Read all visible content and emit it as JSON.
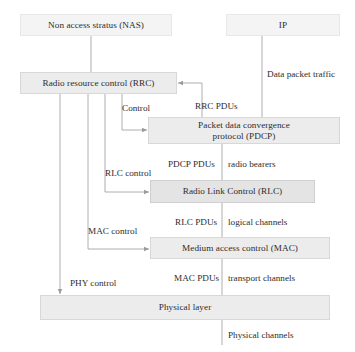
{
  "diagram": {
    "colors": {
      "node_fill": "#ececec",
      "node_fill_faint": "#f4f4f4",
      "node_fill_strong": "#e4e4e4",
      "node_border": "#d8d8d8",
      "line": "#9a9a9a",
      "text": "#2d2d2d"
    },
    "nodes": [
      {
        "id": "nas",
        "label": "Non access stratus (NAS)",
        "x": 20,
        "y": 14,
        "w": 152,
        "h": 22,
        "style": "faint"
      },
      {
        "id": "ip",
        "label": "IP",
        "x": 226,
        "y": 14,
        "w": 114,
        "h": 22,
        "style": "faint"
      },
      {
        "id": "rrc",
        "label": "Radio resource control (RRC)",
        "x": 20,
        "y": 72,
        "w": 157,
        "h": 22,
        "style": "node"
      },
      {
        "id": "pdcp",
        "label": "Packet data convergence\nprotocol (PDCP)",
        "x": 148,
        "y": 117,
        "w": 192,
        "h": 27,
        "style": "node"
      },
      {
        "id": "rlc",
        "label": "Radio Link Control (RLC)",
        "x": 150,
        "y": 180,
        "w": 165,
        "h": 23,
        "style": "strong"
      },
      {
        "id": "mac",
        "label": "Medium access control (MAC)",
        "x": 150,
        "y": 237,
        "w": 180,
        "h": 22,
        "style": "node"
      },
      {
        "id": "phy",
        "label": "Physical layer",
        "x": 40,
        "y": 295,
        "w": 290,
        "h": 25,
        "style": "node"
      }
    ],
    "labels": [
      {
        "id": "data-packet-traffic",
        "text": "Data packet traffic",
        "x": 267,
        "y": 70
      },
      {
        "id": "rrc-pdus",
        "text": "RRC PDUs",
        "x": 195,
        "y": 102
      },
      {
        "id": "control",
        "text": "Control",
        "x": 122,
        "y": 104
      },
      {
        "id": "pdcp-pdus",
        "text": "PDCP PDUs",
        "x": 168,
        "y": 160
      },
      {
        "id": "radio-bearers",
        "text": "radio bearers",
        "x": 228,
        "y": 160
      },
      {
        "id": "rlc-control",
        "text": "RLC control",
        "x": 105,
        "y": 169
      },
      {
        "id": "rlc-pdus",
        "text": "RLC PDUs",
        "x": 175,
        "y": 218
      },
      {
        "id": "logical-channels",
        "text": "logical channels",
        "x": 228,
        "y": 218
      },
      {
        "id": "mac-control",
        "text": "MAC control",
        "x": 88,
        "y": 227
      },
      {
        "id": "mac-pdus",
        "text": "MAC PDUs",
        "x": 174,
        "y": 274
      },
      {
        "id": "transport-channels",
        "text": "transport channels",
        "x": 228,
        "y": 274
      },
      {
        "id": "phy-control",
        "text": "PHY control",
        "x": 70,
        "y": 279
      },
      {
        "id": "physical-channels",
        "text": "Physical channels",
        "x": 228,
        "y": 331
      }
    ]
  }
}
